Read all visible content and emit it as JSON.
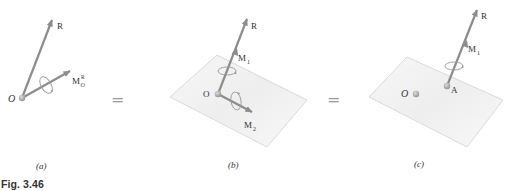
{
  "caption": "Fig. 3.46",
  "colors": {
    "arrow": "#8c8c8c",
    "plane_fill": "#f3f3f3",
    "plane_stroke": "#d6d6d6",
    "point": "#a8a8a8",
    "text": "#333333"
  },
  "panels": [
    {
      "id": "a",
      "label": "(a)",
      "point_label": "O",
      "vectors": [
        {
          "name": "R",
          "label": "R"
        },
        {
          "name": "M_O^R",
          "label": "M",
          "sub": "O",
          "sup": "R"
        }
      ]
    },
    {
      "id": "b",
      "label": "(b)",
      "point_label": "O",
      "vectors": [
        {
          "name": "R",
          "label": "R"
        },
        {
          "name": "M1",
          "label": "M",
          "sub": "1"
        },
        {
          "name": "M2",
          "label": "M",
          "sub": "2"
        }
      ]
    },
    {
      "id": "c",
      "label": "(c)",
      "point_label": "O",
      "second_point_label": "A",
      "vectors": [
        {
          "name": "R",
          "label": "R"
        },
        {
          "name": "M1",
          "label": "M",
          "sub": "1"
        }
      ]
    }
  ],
  "equals": [
    "=",
    "="
  ]
}
